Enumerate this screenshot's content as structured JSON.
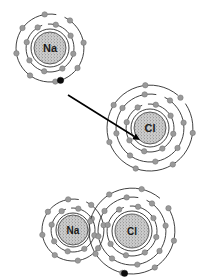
{
  "diagram": {
    "background_color": "#ffffff",
    "width": 204,
    "height": 277,
    "colors": {
      "shell_stroke": "#2b2b2b",
      "electron_fill": "#9a9a9a",
      "electron_stroke": "#6f6f6f",
      "transfer_electron_fill": "#0b0b0b",
      "nucleus_fill": "#c9c9c9",
      "nucleus_stipple": "#4a4a4a",
      "label_color": "#1a1a1a",
      "arrow_color": "#000000"
    }
  },
  "atoms": {
    "na_top": {
      "symbol": "Na",
      "element_name": "sodium",
      "cx": 50,
      "cy": 48,
      "nucleus_r": 16,
      "label_size": 11,
      "shells": [
        {
          "r": 24,
          "electrons": 8
        },
        {
          "r": 34,
          "electrons": 8
        }
      ],
      "valence_electron": {
        "angle_deg": 72,
        "r": 34,
        "transfer": true
      }
    },
    "cl_top": {
      "symbol": "Cl",
      "element_name": "chlorine",
      "cx": 150,
      "cy": 128,
      "nucleus_r": 16,
      "label_size": 11,
      "shells": [
        {
          "r": 24,
          "electrons": 8
        },
        {
          "r": 34,
          "electrons": 8
        },
        {
          "r": 43,
          "electrons": 7
        }
      ]
    },
    "na_bottom": {
      "symbol": "Na",
      "element_name": "sodium ion",
      "cx": 73,
      "cy": 230,
      "nucleus_r": 15,
      "label_size": 10,
      "shells": [
        {
          "r": 22,
          "electrons": 8
        },
        {
          "r": 31,
          "electrons": 8
        }
      ]
    },
    "cl_bottom": {
      "symbol": "Cl",
      "element_name": "chloride ion",
      "cx": 132,
      "cy": 231,
      "nucleus_r": 17,
      "label_size": 10,
      "shells": [
        {
          "r": 25,
          "electrons": 8
        },
        {
          "r": 34,
          "electrons": 8
        },
        {
          "r": 43,
          "electrons": 8
        }
      ],
      "transfer_electron": {
        "angle_deg": 100,
        "r": 43
      }
    }
  },
  "arrow": {
    "label": "electron transfer arrow",
    "x1": 68,
    "y1": 95,
    "x2": 140,
    "y2": 140
  }
}
